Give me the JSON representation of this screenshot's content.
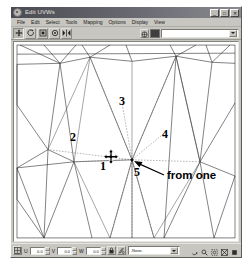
{
  "window": {
    "title": "Edit UVWs",
    "system_icon": "app-icon",
    "buttons": [
      {
        "name": "minimize",
        "glyph": "_"
      },
      {
        "name": "maximize",
        "glyph": "□"
      },
      {
        "name": "close",
        "glyph": "✕"
      }
    ]
  },
  "menubar": {
    "items": [
      {
        "label": "File"
      },
      {
        "label": "Edit"
      },
      {
        "label": "Select"
      },
      {
        "label": "Tools"
      },
      {
        "label": "Mapping"
      },
      {
        "label": "Options"
      },
      {
        "label": "Display"
      },
      {
        "label": "View"
      }
    ]
  },
  "toolbar": {
    "buttons": [
      {
        "name": "move-tool",
        "icon": "move-icon",
        "pressed": true
      },
      {
        "name": "rotate-tool",
        "icon": "rotate-icon",
        "pressed": false
      },
      {
        "name": "scale-tool",
        "icon": "scale-icon",
        "pressed": false
      },
      {
        "name": "freeform-tool",
        "icon": "freeform-icon",
        "pressed": false
      },
      {
        "name": "mirror-tool",
        "icon": "mirror-icon",
        "pressed": false
      }
    ],
    "show_map_button": {
      "name": "show-map-icon"
    },
    "material_swatch": {
      "name": "material-swatch",
      "color": "#3f3f3f"
    },
    "map_combo": {
      "value": "",
      "placeholder": ""
    }
  },
  "canvas": {
    "annotations": [
      {
        "id": "1",
        "label": "1",
        "x": 90,
        "y": 121
      },
      {
        "id": "2",
        "label": "2",
        "x": 62,
        "y": 93
      },
      {
        "id": "3",
        "label": "3",
        "x": 110,
        "y": 58
      },
      {
        "id": "4",
        "label": "4",
        "x": 152,
        "y": 90
      },
      {
        "id": "5",
        "label": "5",
        "x": 125,
        "y": 125
      }
    ],
    "callout": {
      "text": "from one",
      "x": 140,
      "y": 112
    },
    "cursor": {
      "name": "move-cursor",
      "x": 97,
      "y": 113
    }
  },
  "statusbar": {
    "pivot_icon": "pivot-icon",
    "fields": [
      {
        "axis": "U",
        "value": "0.0",
        "name": "u-coordinate"
      },
      {
        "axis": "V",
        "value": "0.0",
        "name": "v-coordinate"
      },
      {
        "axis": "W",
        "value": "0.0",
        "name": "w-coordinate"
      }
    ],
    "lock_icon": "lock-icon",
    "snap_icon": "snap-icon",
    "selection_combo": {
      "value": "-None-"
    },
    "nav_tools": [
      {
        "name": "pan-tool",
        "icon": "hand-icon"
      },
      {
        "name": "zoom-tool",
        "icon": "magnifier-icon"
      },
      {
        "name": "zoom-region-tool",
        "icon": "zoom-region-icon"
      },
      {
        "name": "zoom-extents-tool",
        "icon": "zoom-extents-icon"
      },
      {
        "name": "zoom-extents-selected-tool",
        "icon": "zoom-extents-selected-icon"
      }
    ]
  }
}
